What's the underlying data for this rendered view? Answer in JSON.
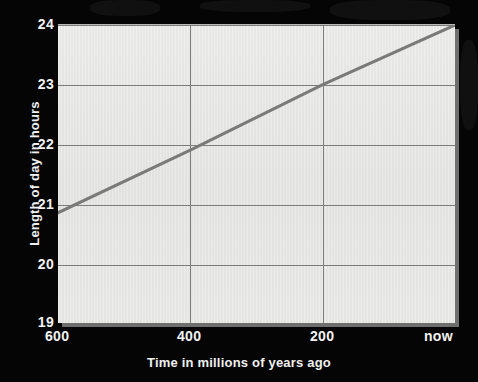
{
  "chart_data": {
    "type": "line",
    "title": "",
    "xlabel": "Time in millions of years ago",
    "ylabel": "Length of day in hours",
    "xlim": [
      600,
      0
    ],
    "ylim": [
      19,
      24
    ],
    "x_reversed": true,
    "grid": true,
    "legend": "none",
    "xticks": [
      {
        "value": 600,
        "label": "600"
      },
      {
        "value": 400,
        "label": "400"
      },
      {
        "value": 200,
        "label": "200"
      },
      {
        "value": 0,
        "label": "now"
      }
    ],
    "yticks": [
      {
        "value": 24,
        "label": "24"
      },
      {
        "value": 23,
        "label": "23"
      },
      {
        "value": 22,
        "label": "22"
      },
      {
        "value": 21,
        "label": "21"
      },
      {
        "value": 20,
        "label": "20"
      },
      {
        "value": 19,
        "label": "19"
      }
    ],
    "series": [
      {
        "name": "Length of day",
        "color": "#7a7a78",
        "linewidth": 3,
        "x": [
          600,
          400,
          200,
          0
        ],
        "y": [
          20.85,
          21.9,
          23.0,
          24.0
        ]
      }
    ]
  },
  "colors": {
    "background": "#000000",
    "plot_background": "#e4e4e2",
    "gridline": "#7c7c7a",
    "line": "#7a7a78",
    "text": "#f2f2f2",
    "shadow": "#6f6f6f"
  }
}
